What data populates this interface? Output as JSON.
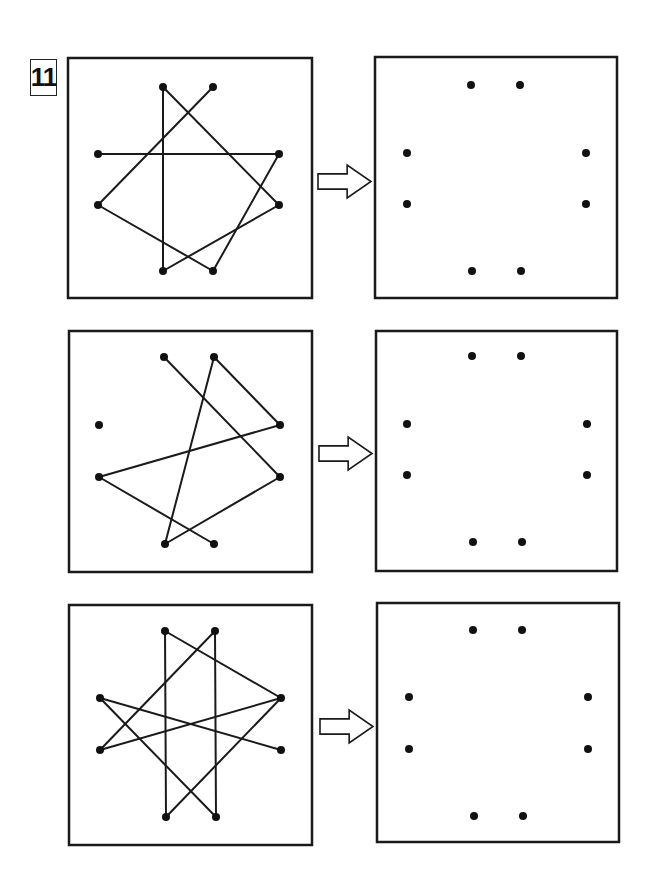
{
  "exercise": {
    "number": "11",
    "instruction_arrow_icon": "right-outline-arrow-icon"
  },
  "colors": {
    "stroke": "#1a1a1a",
    "dot": "#111111",
    "background": "#ffffff"
  },
  "rows": [
    {
      "source": {
        "box": {
          "x": 68,
          "y": 58,
          "w": 244,
          "h": 240
        },
        "points": {
          "TL": [
            163,
            87
          ],
          "TR": [
            213,
            87
          ],
          "LT": [
            98,
            154
          ],
          "RT": [
            279,
            154
          ],
          "LB": [
            98,
            205
          ],
          "RB": [
            279,
            205
          ],
          "BL": [
            163,
            271
          ],
          "BR": [
            213,
            271
          ]
        },
        "segments": [
          [
            "TR",
            "LB"
          ],
          [
            "LB",
            "BR"
          ],
          [
            "BR",
            "RT"
          ],
          [
            "RT",
            "LT"
          ],
          [
            "TL",
            "BL"
          ],
          [
            "TL",
            "RB"
          ],
          [
            "RB",
            "BL"
          ]
        ]
      },
      "arrow": {
        "x": 318,
        "y": 165,
        "w": 53,
        "h": 33
      },
      "target": {
        "box": {
          "x": 375,
          "y": 57,
          "w": 242,
          "h": 241
        },
        "points": {
          "TL": [
            471,
            85
          ],
          "TR": [
            520,
            85
          ],
          "LT": [
            407,
            153
          ],
          "RT": [
            586,
            153
          ],
          "LB": [
            407,
            204
          ],
          "RB": [
            586,
            204
          ],
          "BL": [
            472,
            271
          ],
          "BR": [
            521,
            271
          ]
        }
      }
    },
    {
      "source": {
        "box": {
          "x": 69,
          "y": 331,
          "w": 243,
          "h": 241
        },
        "points": {
          "TL": [
            164,
            357
          ],
          "TR": [
            214,
            357
          ],
          "LT": [
            99,
            425
          ],
          "RT": [
            280,
            425
          ],
          "LB": [
            99,
            477
          ],
          "RB": [
            280,
            477
          ],
          "BL": [
            165,
            544
          ],
          "BR": [
            214,
            544
          ]
        },
        "segments": [
          [
            "TL",
            "RB"
          ],
          [
            "RB",
            "BL"
          ],
          [
            "BL",
            "TR"
          ],
          [
            "TR",
            "RT"
          ],
          [
            "RT",
            "LB"
          ],
          [
            "LB",
            "BR"
          ]
        ]
      },
      "arrow": {
        "x": 319,
        "y": 437,
        "w": 53,
        "h": 33
      },
      "target": {
        "box": {
          "x": 376,
          "y": 331,
          "w": 241,
          "h": 240
        },
        "points": {
          "TL": [
            472,
            356
          ],
          "TR": [
            521,
            356
          ],
          "LT": [
            407,
            424
          ],
          "RT": [
            587,
            424
          ],
          "LB": [
            407,
            475
          ],
          "RB": [
            587,
            475
          ],
          "BL": [
            473,
            542
          ],
          "BR": [
            522,
            542
          ]
        }
      }
    },
    {
      "source": {
        "box": {
          "x": 69,
          "y": 605,
          "w": 243,
          "h": 240
        },
        "points": {
          "TL": [
            165,
            631
          ],
          "TR": [
            215,
            631
          ],
          "LT": [
            100,
            698
          ],
          "RT": [
            281,
            698
          ],
          "LB": [
            100,
            750
          ],
          "RB": [
            281,
            750
          ],
          "BL": [
            166,
            817
          ],
          "BR": [
            216,
            817
          ]
        },
        "segments": [
          [
            "TL",
            "RT"
          ],
          [
            "TL",
            "BL"
          ],
          [
            "TR",
            "LB"
          ],
          [
            "TR",
            "BR"
          ],
          [
            "LT",
            "RB"
          ],
          [
            "LT",
            "BR"
          ],
          [
            "LB",
            "RT"
          ],
          [
            "RT",
            "BL"
          ]
        ]
      },
      "arrow": {
        "x": 320,
        "y": 710,
        "w": 53,
        "h": 33
      },
      "target": {
        "box": {
          "x": 377,
          "y": 603,
          "w": 242,
          "h": 239
        },
        "points": {
          "TL": [
            473,
            630
          ],
          "TR": [
            522,
            630
          ],
          "LT": [
            409,
            697
          ],
          "RT": [
            588,
            697
          ],
          "LB": [
            409,
            749
          ],
          "RB": [
            588,
            749
          ],
          "BL": [
            474,
            816
          ],
          "BR": [
            523,
            816
          ]
        }
      }
    }
  ]
}
